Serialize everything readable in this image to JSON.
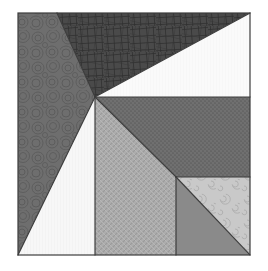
{
  "figure": {
    "type": "vector-geometry",
    "canvas": {
      "width": 268,
      "height": 271
    },
    "background_color": "#ffffff",
    "outline_color": "#3c3c3c",
    "outline_width": 1.2,
    "square": {
      "x": 18,
      "y": 13,
      "width": 232,
      "height": 242
    },
    "center_point": {
      "x": 95,
      "y": 97
    },
    "subsquare": {
      "x": 176,
      "y": 177,
      "width": 74,
      "height": 78
    }
  },
  "regions": [
    {
      "name": "top-crosshatch-triangle",
      "label": "Top dark crosshatch triangle",
      "fill": "#4a4a4a",
      "texture": "crosshatch-scribble",
      "points": "57,13 250,13 95,97"
    },
    {
      "name": "upper-left-circles-wedge",
      "label": "Upper left circle-pattern wedge",
      "fill": "#6e6e6e",
      "texture": "concentric-circles",
      "points": "18,13 57,13 95,97 18,255"
    },
    {
      "name": "top-right-white-triangle",
      "label": "Top right white triangle",
      "fill": "#fafafa",
      "texture": "vertical-hairline",
      "points": "250,13 250,97 95,97"
    },
    {
      "name": "right-dotted-region",
      "label": "Right medium-dark dotted region",
      "fill": "#707070",
      "texture": "fine-dots",
      "points": "95,97 250,97 250,177 176,177"
    },
    {
      "name": "center-white-triangle",
      "label": "Center white triangle",
      "fill": "#f7f7f7",
      "texture": "vertical-hairline",
      "points": "95,97 95,255 18,255"
    },
    {
      "name": "center-weave-region",
      "label": "Center light-gray weave region",
      "fill": "#adadad",
      "texture": "diagonal-weave",
      "points": "95,97 176,177 176,255 95,255"
    },
    {
      "name": "subsquare-swirl-triangle",
      "label": "Bottom right swirl triangle",
      "fill": "#c9c9c9",
      "texture": "spiral-swirls",
      "points": "176,177 250,177 250,255"
    },
    {
      "name": "subsquare-solid-triangle",
      "label": "Bottom right solid gray triangle",
      "fill": "#8a8a8a",
      "texture": "solid",
      "points": "176,177 250,255 176,255"
    }
  ],
  "edges": [
    {
      "name": "square-border",
      "label": "Outer square border"
    },
    {
      "name": "center-to-top-left",
      "label": "Center to top edge split"
    },
    {
      "name": "center-to-top-right",
      "label": "Center to top-right corner"
    },
    {
      "name": "center-horizontal-right",
      "label": "Center horizontal to right edge"
    },
    {
      "name": "center-to-bottom-left",
      "label": "Center to bottom-left corner"
    },
    {
      "name": "center-vertical-down",
      "label": "Center vertical to bottom edge"
    },
    {
      "name": "center-to-subsquare",
      "label": "Center to sub-square corner"
    },
    {
      "name": "subsquare-border",
      "label": "Sub-square border"
    },
    {
      "name": "subsquare-diagonal",
      "label": "Sub-square diagonal"
    }
  ]
}
